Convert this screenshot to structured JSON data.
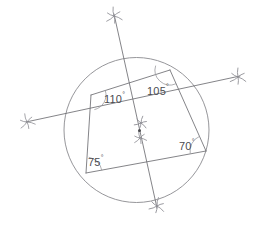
{
  "figure": {
    "background_color": "#ffffff",
    "line_color": "#6e6e72",
    "circle_color": "#8a8a8e",
    "text_color": "#4b4b50"
  },
  "circle": {
    "name": "circumscribed-circle",
    "cx": 136.5,
    "cy": 130.0,
    "r": 72.5
  },
  "vertices": [
    {
      "name": "vertex-top-left",
      "label": "",
      "x": 91.0,
      "y": 95.0
    },
    {
      "name": "vertex-top-right",
      "label": "",
      "x": 170.0,
      "y": 70.0
    },
    {
      "name": "vertex-bottom-right",
      "label": "",
      "x": 206.0,
      "y": 151.0
    },
    {
      "name": "vertex-bottom-left",
      "label": "",
      "x": 86.0,
      "y": 173.0
    }
  ],
  "quadrilateral_sides": [
    {
      "name": "side-top",
      "from": 0,
      "to": 1
    },
    {
      "name": "side-right",
      "from": 1,
      "to": 2
    },
    {
      "name": "side-bottom",
      "from": 2,
      "to": 3
    },
    {
      "name": "side-left",
      "from": 3,
      "to": 0
    }
  ],
  "interior_angles": [
    {
      "name": "angle-label-110",
      "value": "110",
      "degree_symbol": "°",
      "x": 104,
      "y": 103,
      "vertex": 0
    },
    {
      "name": "angle-label-105",
      "value": "105",
      "degree_symbol": "°",
      "x": 147,
      "y": 95,
      "vertex": 1
    },
    {
      "name": "angle-label-70",
      "value": "70",
      "degree_symbol": "°",
      "x": 179,
      "y": 150,
      "vertex": 2
    },
    {
      "name": "angle-label-75",
      "value": "75",
      "degree_symbol": "°",
      "x": 88,
      "y": 166,
      "vertex": 3
    }
  ],
  "angle_arcs": [
    {
      "name": "angle-arc-110",
      "cx": 91.0,
      "cy": 95.0,
      "r": 15,
      "a1": -17,
      "a2": 77
    },
    {
      "name": "angle-arc-105",
      "cx": 170.0,
      "cy": 70.0,
      "r": 15,
      "a1": 66,
      "a2": 197
    },
    {
      "name": "angle-arc-70",
      "cx": 206.0,
      "cy": 151.0,
      "r": 16,
      "a1": 170,
      "a2": 246
    },
    {
      "name": "angle-arc-75",
      "cx": 86.0,
      "cy": 173.0,
      "r": 16,
      "a1": -80,
      "a2": -9
    }
  ],
  "transversals": [
    {
      "name": "transversal-vertical",
      "x1": 114.0,
      "y1": 14.0,
      "x2": 157.0,
      "y2": 208.0,
      "marker_start": "star",
      "marker_end": "star"
    },
    {
      "name": "transversal-horizontal",
      "x1": 26.0,
      "y1": 122.0,
      "x2": 240.0,
      "y2": 76.0,
      "marker_start": "star",
      "marker_end": "star"
    }
  ],
  "star_markers": [
    {
      "name": "star-marker-top",
      "x": 114.0,
      "y": 16.0,
      "r": 9,
      "rot": 10
    },
    {
      "name": "star-marker-bottom",
      "x": 157.0,
      "y": 206.0,
      "r": 8.5,
      "rot": 25
    },
    {
      "name": "star-marker-left",
      "x": 27.0,
      "y": 122.0,
      "r": 8.5,
      "rot": 0
    },
    {
      "name": "star-marker-right",
      "x": 238.0,
      "y": 77.0,
      "r": 9,
      "rot": 15
    },
    {
      "name": "star-marker-center-upper",
      "x": 141.0,
      "y": 123.0,
      "r": 7,
      "rot": 30
    },
    {
      "name": "star-marker-center-lower",
      "x": 140.0,
      "y": 138.0,
      "r": 7,
      "rot": 5
    }
  ],
  "intersection_point": {
    "name": "chord-intersection-point",
    "x": 139.5,
    "y": 130.5
  }
}
